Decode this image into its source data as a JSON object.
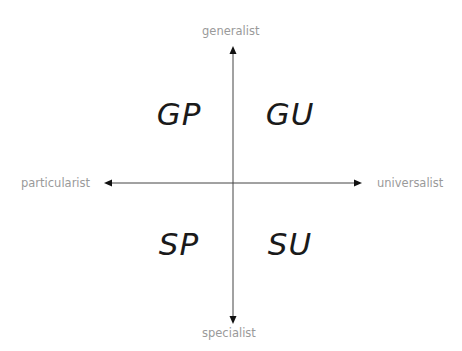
{
  "diagram": {
    "type": "quadrant",
    "axes": {
      "top": "generalist",
      "bottom": "specialist",
      "left": "particularist",
      "right": "universalist"
    },
    "quadrants": {
      "top_left": "GP",
      "top_right": "GU",
      "bottom_left": "SP",
      "bottom_right": "SU"
    },
    "colors": {
      "axis_line": "#333333",
      "axis_label": "#9a9a9a",
      "quadrant_text": "#1a1a1a"
    }
  }
}
